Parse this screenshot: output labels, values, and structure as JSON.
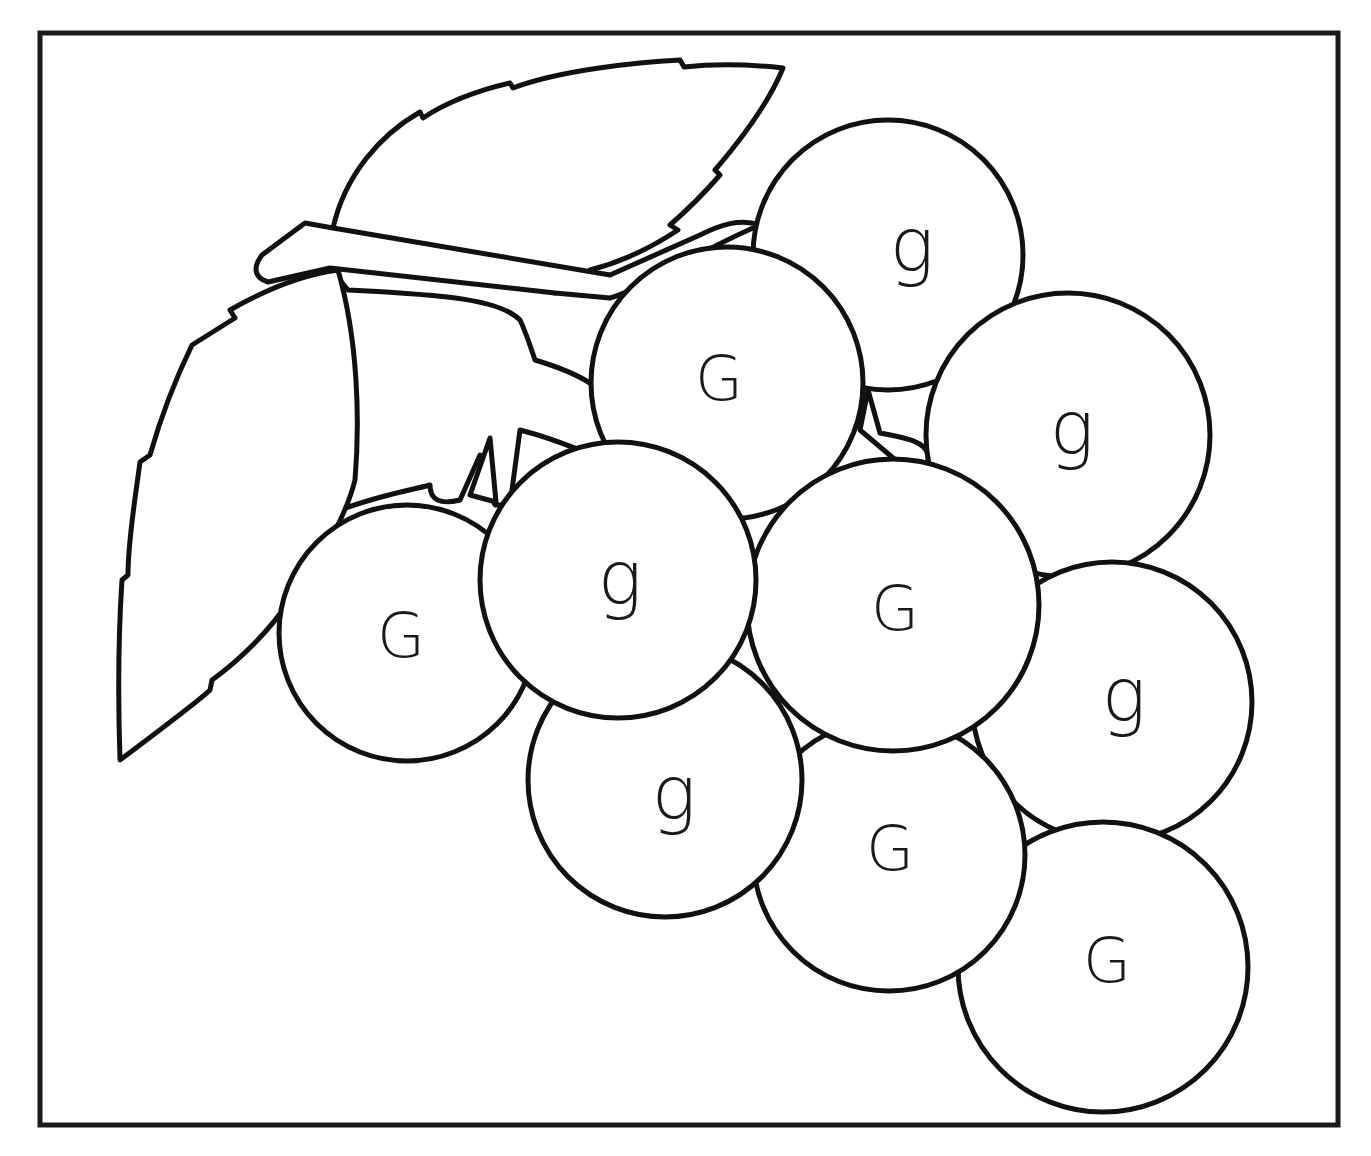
{
  "worksheet": {
    "type": "letter-recognition coloring page",
    "subject": "bunch of grapes",
    "letters_used": [
      "G",
      "g"
    ],
    "colors": {
      "line": "#111111",
      "background": "#ffffff",
      "border": "#1a1a1a"
    }
  },
  "grapes": [
    {
      "id": "grape-top-right",
      "letter": "g",
      "cx": 888,
      "cy": 255,
      "r": 135
    },
    {
      "id": "grape-right-upper",
      "letter": "g",
      "cx": 1068,
      "cy": 435,
      "r": 142
    },
    {
      "id": "grape-center-top",
      "letter": "G",
      "cx": 727,
      "cy": 383,
      "r": 136
    },
    {
      "id": "grape-left",
      "letter": "G",
      "cx": 407,
      "cy": 633,
      "r": 128
    },
    {
      "id": "grape-right-lower",
      "letter": "g",
      "cx": 1112,
      "cy": 702,
      "r": 140
    },
    {
      "id": "grape-bottom-right",
      "letter": "G",
      "cx": 1103,
      "cy": 967,
      "r": 145
    },
    {
      "id": "grape-bottom-middle",
      "letter": "G",
      "cx": 889,
      "cy": 855,
      "r": 136
    },
    {
      "id": "grape-lower",
      "letter": "g",
      "cx": 665,
      "cy": 780,
      "r": 137
    },
    {
      "id": "grape-center-right",
      "letter": "G",
      "cx": 893,
      "cy": 605,
      "r": 146
    },
    {
      "id": "grape-center",
      "letter": "g",
      "cx": 618,
      "cy": 580,
      "r": 138
    }
  ],
  "labels": {
    "g0": "g",
    "g1": "g",
    "g2": "G",
    "g3": "G",
    "g4": "g",
    "g5": "G",
    "g6": "G",
    "g7": "g",
    "g8": "G",
    "g9": "g"
  }
}
